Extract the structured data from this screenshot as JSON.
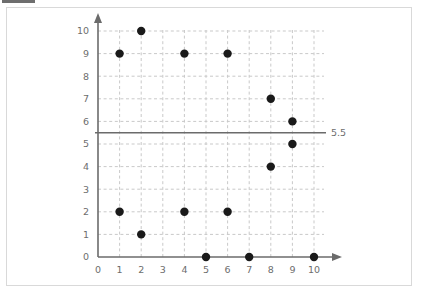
{
  "top_strip": {
    "swatch_color": "#6e6e6e",
    "ghost_text": "— — — —   — —  — —  —"
  },
  "card": {
    "border_color": "#d9d9d9",
    "background": "#ffffff"
  },
  "chart_data": {
    "type": "scatter",
    "title": "",
    "subtitle": "",
    "xlabel": "",
    "ylabel": "",
    "xlim": [
      0,
      10
    ],
    "ylim": [
      0,
      10
    ],
    "xticks": [
      0,
      1,
      2,
      3,
      4,
      5,
      6,
      7,
      8,
      9,
      10
    ],
    "yticks": [
      0,
      1,
      2,
      3,
      4,
      5,
      6,
      7,
      8,
      9,
      10
    ],
    "xtick_labels": [
      "0",
      "1",
      "2",
      "3",
      "4",
      "5",
      "6",
      "7",
      "8",
      "9",
      "10"
    ],
    "ytick_labels": [
      "0",
      "1",
      "2",
      "3",
      "4",
      "5",
      "6",
      "7",
      "8",
      "9",
      "10"
    ],
    "grid": true,
    "grid_style": "dashed",
    "grid_color": "#c9c9c9",
    "legend": false,
    "legend_position": "none",
    "axis_color": "#6b6b6b",
    "point_color": "#1a1a1a",
    "point_size": 4.2,
    "axes_have_arrowheads": true,
    "points": [
      {
        "x": 1,
        "y": 9
      },
      {
        "x": 2,
        "y": 10
      },
      {
        "x": 4,
        "y": 9
      },
      {
        "x": 6,
        "y": 9
      },
      {
        "x": 8,
        "y": 7
      },
      {
        "x": 9,
        "y": 6
      },
      {
        "x": 9,
        "y": 5
      },
      {
        "x": 8,
        "y": 4
      },
      {
        "x": 1,
        "y": 2
      },
      {
        "x": 4,
        "y": 2
      },
      {
        "x": 6,
        "y": 2
      },
      {
        "x": 2,
        "y": 1
      },
      {
        "x": 5,
        "y": 0
      },
      {
        "x": 7,
        "y": 0
      },
      {
        "x": 10,
        "y": 0
      }
    ],
    "annotations": [
      {
        "type": "hline",
        "value": 5.5,
        "label": "5.5",
        "color": "#6b6b6b",
        "style": "solid"
      }
    ]
  }
}
